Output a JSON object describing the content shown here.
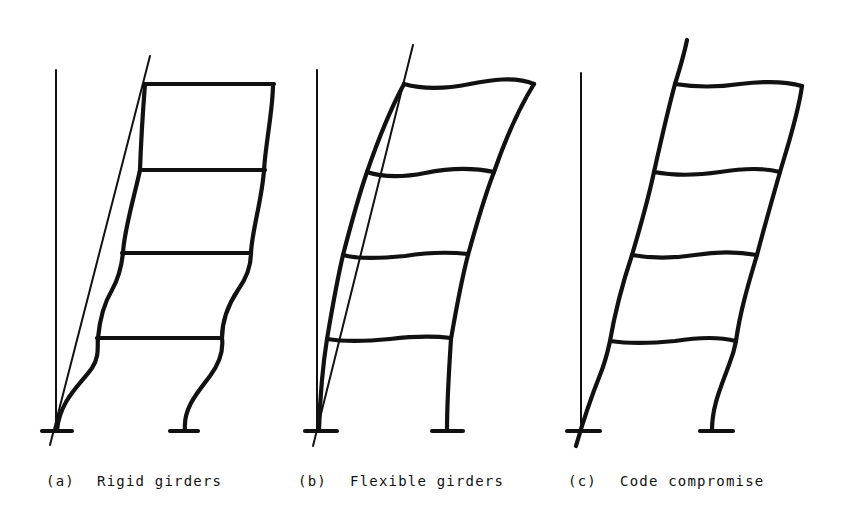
{
  "figure": {
    "panels": [
      {
        "id": "a",
        "tag": "(a)",
        "caption": "Rigid girders"
      },
      {
        "id": "b",
        "tag": "(b)",
        "caption": "Flexible girders"
      },
      {
        "id": "c",
        "tag": "(c)",
        "caption": "Code compromise"
      }
    ],
    "stories": 4,
    "line_color": "#111111",
    "background": "#ffffff"
  }
}
